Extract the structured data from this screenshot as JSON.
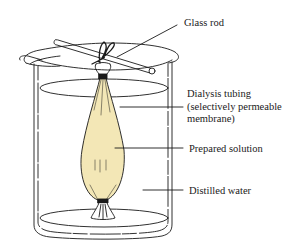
{
  "diagram": {
    "type": "labeled apparatus illustration",
    "colors": {
      "line": "#1a1a1a",
      "solution_fill": "#f3e7b6",
      "background": "#ffffff"
    },
    "labels": [
      {
        "id": "glass-rod",
        "lines": [
          "Glass rod"
        ]
      },
      {
        "id": "dialysis-tubing",
        "lines": [
          "Dialysis tubing",
          "(selectively permeable",
          "membrane)"
        ]
      },
      {
        "id": "prepared-solution",
        "lines": [
          "Prepared solution"
        ]
      },
      {
        "id": "distilled-water",
        "lines": [
          "Distilled water"
        ]
      }
    ]
  }
}
